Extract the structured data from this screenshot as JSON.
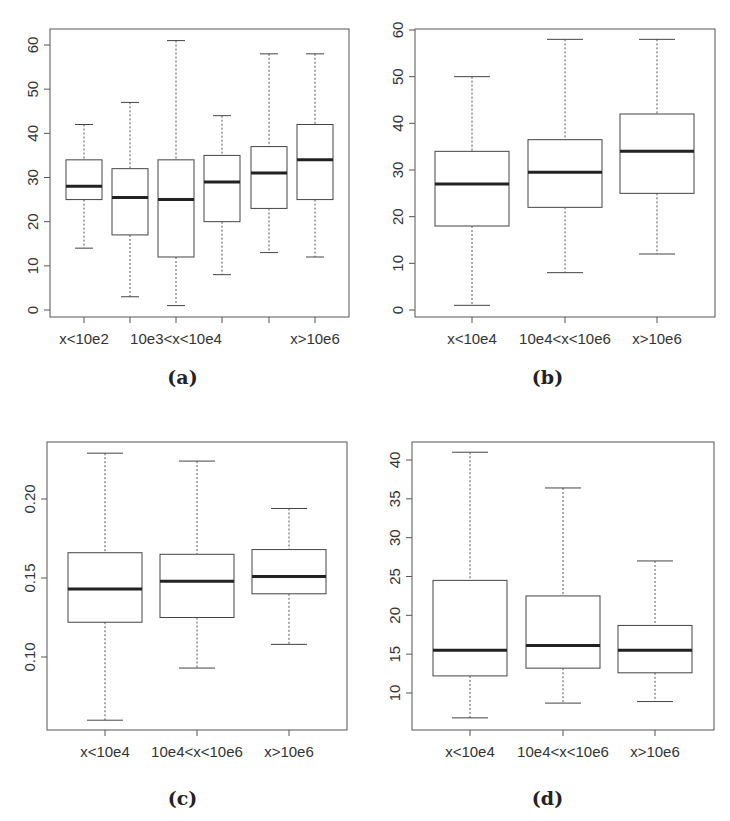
{
  "chart_data": [
    {
      "panel": "(a)",
      "type": "boxplot",
      "title": "",
      "xlabel": "",
      "ylabel": "",
      "ylim": [
        0,
        62
      ],
      "yticks": [
        0,
        10,
        20,
        30,
        40,
        50,
        60
      ],
      "categories": [
        "x<10e2",
        "",
        "10e3<x<10e4",
        "",
        "",
        "x>10e6"
      ],
      "tick_labels_shown": [
        "x<10e2",
        "10e3<x<10e4",
        "x>10e6"
      ],
      "boxes": [
        {
          "min": 14,
          "q1": 25,
          "median": 28,
          "q3": 34,
          "max": 42
        },
        {
          "min": 3,
          "q1": 17,
          "median": 25.5,
          "q3": 32,
          "max": 47
        },
        {
          "min": 1,
          "q1": 12,
          "median": 25,
          "q3": 34,
          "max": 61
        },
        {
          "min": 8,
          "q1": 20,
          "median": 29,
          "q3": 35,
          "max": 44
        },
        {
          "min": 13,
          "q1": 23,
          "median": 31,
          "q3": 37,
          "max": 58
        },
        {
          "min": 12,
          "q1": 25,
          "median": 34,
          "q3": 42,
          "max": 58
        }
      ]
    },
    {
      "panel": "(b)",
      "type": "boxplot",
      "title": "",
      "xlabel": "",
      "ylabel": "",
      "ylim": [
        0,
        60
      ],
      "yticks": [
        0,
        10,
        20,
        30,
        40,
        50,
        60
      ],
      "categories": [
        "x<10e4",
        "10e4<x<10e6",
        "x>10e6"
      ],
      "boxes": [
        {
          "min": 1,
          "q1": 18,
          "median": 27,
          "q3": 34,
          "max": 50
        },
        {
          "min": 8,
          "q1": 22,
          "median": 29.5,
          "q3": 36.5,
          "max": 58
        },
        {
          "min": 12,
          "q1": 25,
          "median": 34,
          "q3": 42,
          "max": 58
        }
      ]
    },
    {
      "panel": "(c)",
      "type": "boxplot",
      "title": "",
      "xlabel": "",
      "ylabel": "",
      "ylim": [
        0.055,
        0.235
      ],
      "yticks": [
        0.1,
        0.15,
        0.2
      ],
      "ytick_labels": [
        "0.10",
        "0.15",
        "0.20"
      ],
      "categories": [
        "x<10e4",
        "10e4<x<10e6",
        "x>10e6"
      ],
      "boxes": [
        {
          "min": 0.06,
          "q1": 0.122,
          "median": 0.143,
          "q3": 0.166,
          "max": 0.229
        },
        {
          "min": 0.093,
          "q1": 0.125,
          "median": 0.148,
          "q3": 0.165,
          "max": 0.224
        },
        {
          "min": 0.108,
          "q1": 0.14,
          "median": 0.151,
          "q3": 0.168,
          "max": 0.194
        }
      ]
    },
    {
      "panel": "(d)",
      "type": "boxplot",
      "title": "",
      "xlabel": "",
      "ylabel": "",
      "ylim": [
        6.5,
        41.5
      ],
      "yticks": [
        10,
        15,
        20,
        25,
        30,
        35,
        40
      ],
      "categories": [
        "x<10e4",
        "10e4<x<10e6",
        "x>10e6"
      ],
      "boxes": [
        {
          "min": 6.8,
          "q1": 12.2,
          "median": 15.5,
          "q3": 24.5,
          "max": 41
        },
        {
          "min": 8.7,
          "q1": 13.2,
          "median": 16.1,
          "q3": 22.5,
          "max": 36.4
        },
        {
          "min": 8.9,
          "q1": 12.6,
          "median": 15.5,
          "q3": 18.7,
          "max": 27
        }
      ]
    }
  ],
  "captions": {
    "a": "(a)",
    "b": "(b)",
    "c": "(c)",
    "d": "(d)"
  },
  "layout": [
    {
      "left": 0,
      "top": 0,
      "frame": [
        50,
        29,
        349,
        317
      ],
      "ypix": [
        [
          0,
          310
        ],
        [
          60,
          45
        ]
      ],
      "xcenters": [
        84,
        130,
        176,
        222,
        269,
        315
      ],
      "boxhalf": 18,
      "caphalf": 9,
      "xlabel_y": 332,
      "caption_y": 340
    },
    {
      "left": 365,
      "top": 0,
      "frame": [
        415,
        29,
        715,
        317
      ],
      "ypix": [
        [
          0,
          310
        ],
        [
          60,
          30
        ]
      ],
      "xcenters": [
        472,
        565,
        657
      ],
      "boxhalf": 37,
      "caphalf": 18,
      "xlabel_y": 332,
      "caption_y": 340
    },
    {
      "left": 0,
      "top": 410,
      "frame": [
        47,
        442,
        347,
        730
      ],
      "ypix": [
        [
          0.1,
          657
        ],
        [
          0.2,
          499
        ]
      ],
      "xcenters": [
        105,
        197,
        289
      ],
      "boxhalf": 37,
      "caphalf": 18,
      "xlabel_y": 745,
      "caption_y": 755
    },
    {
      "left": 365,
      "top": 410,
      "frame": [
        412,
        442,
        714,
        730
      ],
      "ypix": [
        [
          10,
          693
        ],
        [
          40,
          460
        ]
      ],
      "xcenters": [
        470,
        563,
        655
      ],
      "boxhalf": 37,
      "caphalf": 18,
      "xlabel_y": 745,
      "caption_y": 755
    }
  ]
}
